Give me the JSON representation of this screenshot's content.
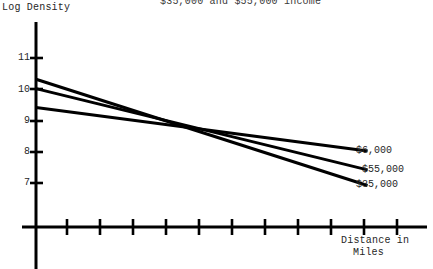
{
  "chart_data": {
    "type": "line",
    "title": "$35,000 and $55,000 income",
    "ylabel": "Log Density",
    "xlabel": "Distance in Miles",
    "xlabel_line1": "Distance in",
    "xlabel_line2": "Miles",
    "ylim": [
      6.5,
      11.4
    ],
    "xlim": [
      0,
      11
    ],
    "yticks": [
      11,
      10,
      9,
      8,
      7
    ],
    "ytick_labels": [
      "11",
      "10",
      "9",
      "8",
      "7"
    ],
    "xticks": [
      1,
      2,
      3,
      4,
      5,
      6,
      7,
      8,
      9,
      10,
      11
    ],
    "xtick_labels": [
      "",
      "",
      "",
      "",
      "",
      "",
      "",
      "",
      "",
      "",
      ""
    ],
    "grid": false,
    "legend_position": "right-inline-end-of-line",
    "series": [
      {
        "name": "$6,000",
        "label": "$6,000",
        "color": "#000000",
        "x": [
          0,
          10.1
        ],
        "values": [
          9.42,
          8.02
        ]
      },
      {
        "name": "$55,000",
        "label": "$55,000",
        "color": "#000000",
        "x": [
          0,
          10.1
        ],
        "values": [
          10.02,
          7.42
        ]
      },
      {
        "name": "$35,000",
        "label": "$35,000",
        "color": "#000000",
        "x": [
          0,
          10.1
        ],
        "values": [
          10.32,
          6.92
        ]
      }
    ],
    "axis_color": "#000000"
  },
  "axis": {
    "y_tick_values": [
      "11",
      "10",
      "9",
      "8",
      "7"
    ]
  },
  "series_labels": {
    "top": "$6,000",
    "middle": "$55,000",
    "bottom": "$35,000"
  }
}
